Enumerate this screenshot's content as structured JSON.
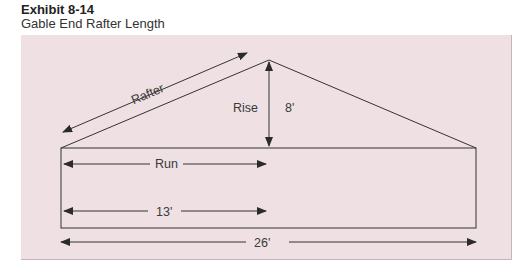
{
  "header": {
    "exhibit_number": "Exhibit 8-14",
    "title": "Gable End Rafter Length"
  },
  "diagram": {
    "colors": {
      "background": "#efe0e4",
      "line": "#333333",
      "text": "#3a3a3a"
    },
    "labels": {
      "rafter": "Rafter",
      "rise": "Rise",
      "rise_value": "8'",
      "run": "Run",
      "run_value": "13'",
      "span_value": "26'"
    }
  }
}
